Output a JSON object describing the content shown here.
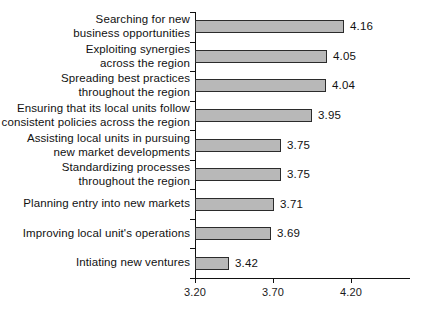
{
  "chart_data": {
    "type": "bar",
    "orientation": "horizontal",
    "title": "",
    "subtitle": "",
    "xlabel": "",
    "ylabel": "",
    "xlim": [
      3.2,
      4.45
    ],
    "grid": false,
    "legend": null,
    "axis_ticks": [
      "3.20",
      "3.70",
      "4.20"
    ],
    "axis_tick_values": [
      3.2,
      3.7,
      4.2
    ],
    "categories": [
      "Searching for new\nbusiness opportunities",
      "Exploiting synergies\nacross the region",
      "Spreading best practices\nthroughout the region",
      "Ensuring that its local units follow\nconsistent policies across the region",
      "Assisting local units in pursuing\nnew market developments",
      "Standardizing processes\nthroughout the region",
      "Planning entry into new markets",
      "Improving local unit's operations",
      "Intiating new ventures"
    ],
    "values": [
      4.16,
      4.05,
      4.04,
      3.95,
      3.75,
      3.75,
      3.71,
      3.69,
      3.42
    ],
    "value_labels": [
      "4.16",
      "4.05",
      "4.04",
      "3.95",
      "3.75",
      "3.75",
      "3.71",
      "3.69",
      "3.42"
    ],
    "bar_fill_color": "#b8b8b8",
    "bar_border_color": "#2b2b2b",
    "axis_color": "#111111",
    "background_color": "#ffffff"
  }
}
